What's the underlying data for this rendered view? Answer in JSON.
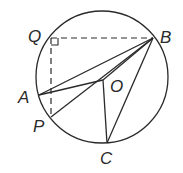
{
  "diagram": {
    "type": "geometry-circle",
    "circle": {
      "cx": 102,
      "cy": 77,
      "r": 66
    },
    "points": {
      "Q": {
        "x": 51,
        "y": 38,
        "label": "Q",
        "lx": 28,
        "ly": 42
      },
      "B": {
        "x": 153,
        "y": 38,
        "label": "B",
        "lx": 160,
        "ly": 43
      },
      "A": {
        "x": 39,
        "y": 95,
        "label": "A",
        "lx": 18,
        "ly": 103
      },
      "O": {
        "x": 103,
        "y": 80,
        "label": "O",
        "lx": 110,
        "ly": 92
      },
      "P": {
        "x": 51,
        "y": 117,
        "label": "P",
        "lx": 33,
        "ly": 132
      },
      "C": {
        "x": 107,
        "y": 143,
        "label": "C",
        "lx": 100,
        "ly": 164
      }
    },
    "segments": [
      "A-B",
      "A-O",
      "O-B",
      "P-B",
      "O-C",
      "C-B"
    ],
    "dashed_segments": [
      "Q-B",
      "Q-P"
    ],
    "right_angle_at": "Q",
    "stroke_color": "#2a2a2a"
  }
}
